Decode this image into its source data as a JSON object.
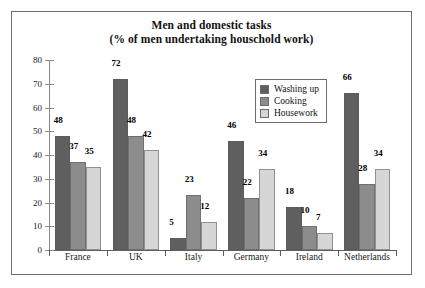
{
  "chart_data": {
    "type": "bar",
    "title": "Men and domestic tasks",
    "subtitle": "(% of men undertaking houschold work)",
    "xlabel": "",
    "ylabel": "",
    "ylim": [
      0,
      80
    ],
    "yticks": [
      0,
      10,
      20,
      30,
      40,
      50,
      60,
      70,
      80
    ],
    "grid": false,
    "legend_position": "inside-top-right",
    "categories": [
      "France",
      "UK",
      "Italy",
      "Germany",
      "Ireland",
      "Netherlands"
    ],
    "series": [
      {
        "name": "Washing up",
        "color": "#5f5f5f",
        "values": [
          48,
          72,
          5,
          46,
          18,
          66
        ]
      },
      {
        "name": "Cooking",
        "color": "#8c8c8c",
        "values": [
          37,
          48,
          23,
          22,
          10,
          28
        ]
      },
      {
        "name": "Housework",
        "color": "#d6d6d6",
        "values": [
          35,
          42,
          12,
          34,
          7,
          34
        ]
      }
    ]
  },
  "frame": {
    "border_color": "#6f6f6f",
    "background": "#ffffff"
  }
}
